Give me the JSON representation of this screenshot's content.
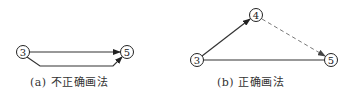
{
  "diagrams": [
    {
      "id": "a",
      "caption": "(a) 不正确画法",
      "nodes": [
        {
          "label": "3",
          "x": 23,
          "y": 52
        },
        {
          "label": "5",
          "x": 127,
          "y": 52
        }
      ],
      "edges": [
        {
          "from": "3",
          "to": "5",
          "style": "solid",
          "arrow": true,
          "path": "straight"
        },
        {
          "from": "3",
          "to": "5",
          "style": "solid",
          "arrow": true,
          "path": "lower-bend"
        }
      ]
    },
    {
      "id": "b",
      "caption": "(b) 正确画法",
      "nodes": [
        {
          "label": "3",
          "x": 197,
          "y": 60
        },
        {
          "label": "4",
          "x": 256,
          "y": 15
        },
        {
          "label": "5",
          "x": 331,
          "y": 60
        }
      ],
      "edges": [
        {
          "from": "3",
          "to": "4",
          "style": "solid",
          "arrow": true
        },
        {
          "from": "4",
          "to": "5",
          "style": "dashed",
          "arrow": true
        },
        {
          "from": "3",
          "to": "5",
          "style": "solid",
          "arrow": false
        }
      ]
    }
  ],
  "colors": {
    "line": "#333333",
    "dashed": "#777777",
    "text": "#1a1a1a"
  }
}
